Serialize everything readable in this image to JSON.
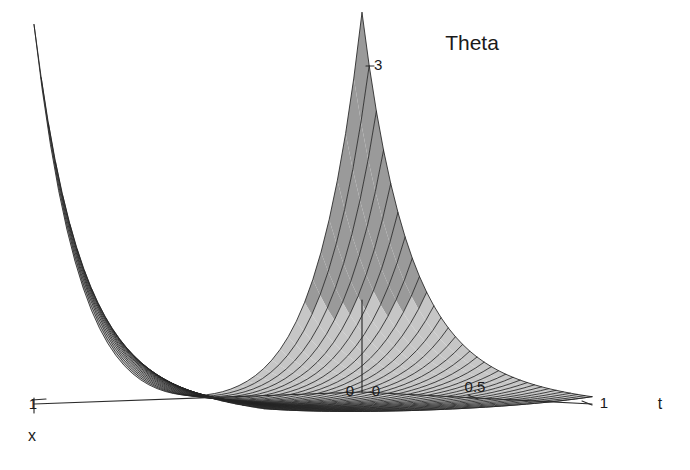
{
  "title": "Theta",
  "axes": {
    "t": {
      "name": "t",
      "ticks": [
        "0",
        "0.5",
        "1"
      ],
      "range": [
        0,
        1
      ]
    },
    "x": {
      "name": "x",
      "ticks": [
        "1",
        "0"
      ],
      "range": [
        0,
        1
      ]
    },
    "z": {
      "name": "",
      "ticks": [
        "0",
        "3"
      ],
      "range": [
        0,
        3
      ]
    }
  },
  "colors": {
    "surface_fill": "#c6c6c6",
    "surface_fill_dark": "#9a9a9a",
    "mesh_line": "#242424",
    "axis": "#2b2b2b",
    "text": "#1a1a1a",
    "background": "#ffffff"
  },
  "chart_data": {
    "type": "surface3d",
    "title": "Theta",
    "xlabel": "x",
    "ylabel": "t",
    "zlabel": "Theta",
    "xlim": [
      0,
      1
    ],
    "ylim": [
      0,
      1
    ],
    "zlim": [
      0,
      3
    ],
    "xticks": [
      0,
      1
    ],
    "yticks": [
      0,
      0.5,
      1
    ],
    "zticks": [
      0,
      3
    ],
    "grid": false,
    "legend": false,
    "surface_function": "Theta(x,t) = 3 * ((1-x)^8 + x^8) * exp(-5.2*t) + 0.45*exp(-2.2*t)*(1 - 4*x*(1-x))",
    "x_samples": 41,
    "t_samples": 33,
    "peaks": [
      {
        "label": "left-ridge",
        "x": 0,
        "t": 0,
        "z": 3.0
      },
      {
        "label": "right-ridge",
        "x": 1,
        "t": 0,
        "z": 3.0
      }
    ],
    "valley": {
      "label": "center-valley",
      "x": 0.5,
      "t": 0.0,
      "z": 0.0
    }
  }
}
